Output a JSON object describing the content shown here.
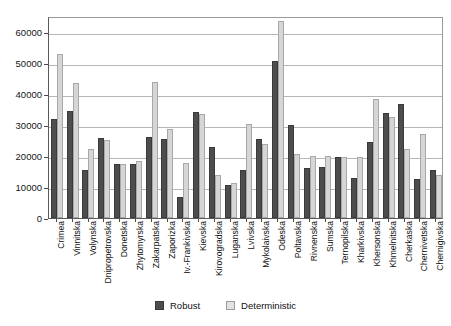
{
  "chart_data": {
    "type": "bar",
    "title": "",
    "xlabel": "",
    "ylabel": "",
    "ylim": [
      0,
      65000
    ],
    "yticks": [
      0,
      10000,
      20000,
      30000,
      40000,
      50000,
      60000
    ],
    "ytick_labels": [
      "0",
      "10000",
      "20000",
      "30000",
      "40000",
      "50000",
      "60000"
    ],
    "grid": true,
    "legend_position": "bottom",
    "categories": [
      "Crimea",
      "Vinnitska",
      "Volynska",
      "Dnipropetrovska",
      "Donetska",
      "Zhytomyrska",
      "Zakarpatska",
      "Zaporizka",
      "Iv.-Frankivska",
      "Kievska",
      "Kirovogradska",
      "Luganska",
      "Lvivska",
      "Mykolaivska",
      "Odeska",
      "Poltavska",
      "Rivnenska",
      "Sumska",
      "Ternopilska",
      "Kharkivska",
      "Khersonska",
      "Khmelnitska",
      "Cherkaska",
      "Chernivetska",
      "Chernigivska"
    ],
    "series": [
      {
        "name": "Robust",
        "color": "#4d4d4d",
        "values": [
          31800,
          34500,
          15500,
          25800,
          17300,
          17300,
          26000,
          25400,
          6800,
          34000,
          23000,
          10700,
          15300,
          25300,
          50400,
          30000,
          16200,
          16300,
          19600,
          12800,
          24300,
          33700,
          36800,
          12400,
          15400
        ]
      },
      {
        "name": "Deterministic",
        "color": "#d6d6d6",
        "values": [
          52700,
          43300,
          22100,
          25200,
          17300,
          18200,
          43700,
          28500,
          17700,
          33400,
          14000,
          11300,
          30300,
          23800,
          63400,
          20700,
          20000,
          20100,
          19500,
          19700,
          38400,
          32400,
          22300,
          26900,
          13900
        ]
      }
    ]
  },
  "legend": {
    "items": [
      {
        "label": "Robust",
        "swatch": "robust-swatch"
      },
      {
        "label": "Deterministic",
        "swatch": "deterministic-swatch"
      }
    ]
  }
}
